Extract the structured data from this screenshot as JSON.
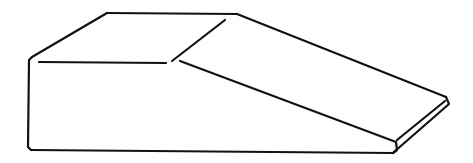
{
  "figure": {
    "background": "#ffffff",
    "stroke_color": "#111111",
    "labels": []
  }
}
